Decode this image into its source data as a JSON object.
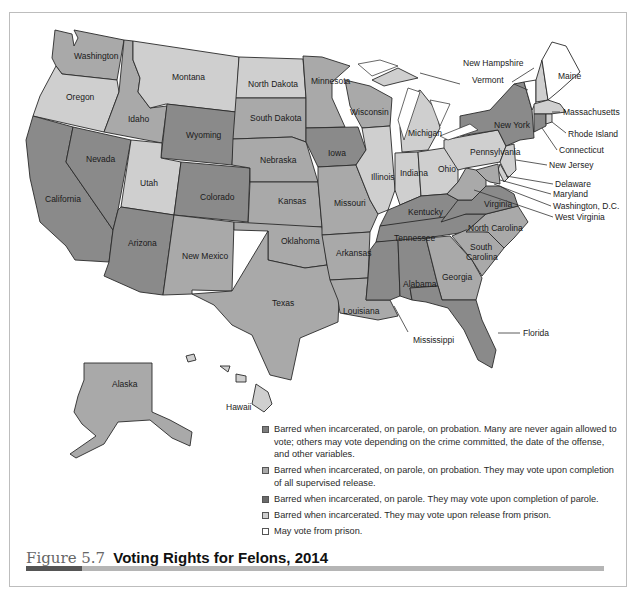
{
  "figure": {
    "number": "Figure 5.7",
    "title": "Voting Rights for Felons, 2014"
  },
  "legend": {
    "items": [
      {
        "key": "c1",
        "color": "#7d7d7d",
        "label": "Barred when incarcerated, on parole, on probation. Many are never again allowed to vote; others may vote depending on the crime committed, the date of the offense, and other variables."
      },
      {
        "key": "c2",
        "color": "#a9a9a9",
        "label": "Barred when incarcerated, on parole, on probation. They may vote upon completion of all supervised release."
      },
      {
        "key": "c3",
        "color": "#6a6a6a",
        "label": "Barred when incarcerated, on parole. They may vote upon completion of parole."
      },
      {
        "key": "c4",
        "color": "#cfcfcf",
        "label": "Barred when incarcerated. They may vote upon release from prison."
      },
      {
        "key": "c5",
        "color": "#ffffff",
        "label": "May vote from prison."
      }
    ]
  },
  "states": {
    "washington": "Washington",
    "oregon": "Oregon",
    "california": "California",
    "idaho": "Idaho",
    "nevada": "Nevada",
    "montana": "Montana",
    "wyoming": "Wyoming",
    "utah": "Utah",
    "colorado": "Colorado",
    "arizona": "Arizona",
    "new_mexico": "New Mexico",
    "north_dakota": "North Dakota",
    "south_dakota": "South Dakota",
    "nebraska": "Nebraska",
    "kansas": "Kansas",
    "oklahoma": "Oklahoma",
    "texas": "Texas",
    "minnesota": "Minnesota",
    "iowa": "Iowa",
    "missouri": "Missouri",
    "arkansas": "Arkansas",
    "louisiana": "Louisiana",
    "wisconsin": "Wisconsin",
    "illinois": "Illinois",
    "michigan": "Michigan",
    "indiana": "Indiana",
    "ohio": "Ohio",
    "kentucky": "Kentucky",
    "tennessee": "Tennessee",
    "mississippi": "Mississippi",
    "alabama": "Alabama",
    "georgia": "Georgia",
    "florida": "Florida",
    "south_carolina_1": "South",
    "south_carolina_2": "Carolina",
    "north_carolina": "North Carolina",
    "virginia": "Virginia",
    "west_virginia": "West Virginia",
    "pennsylvania": "Pennsylvania",
    "new_york": "New York",
    "new_jersey": "New Jersey",
    "delaware": "Delaware",
    "maryland": "Maryland",
    "dc": "Washington, D.C.",
    "connecticut": "Connecticut",
    "rhode_island": "Rhode Island",
    "massachusetts": "Massachusetts",
    "vermont": "Vermont",
    "new_hampshire": "New Hampshire",
    "maine": "Maine",
    "alaska": "Alaska",
    "hawaii": "Hawaii"
  }
}
